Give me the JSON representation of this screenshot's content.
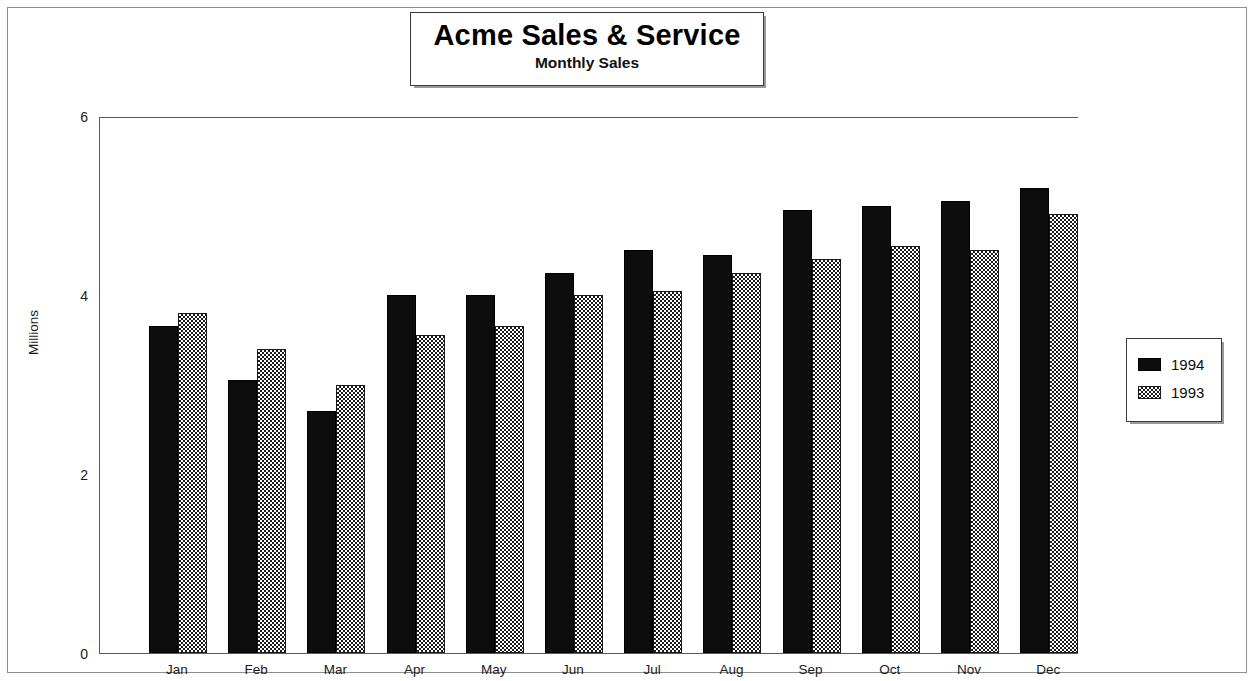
{
  "title_box": {
    "title": "Acme Sales & Service",
    "subtitle": "Monthly Sales"
  },
  "axes": {
    "y_title": "Millions",
    "y_ticks": [
      "0",
      "2",
      "4",
      "6"
    ]
  },
  "legend": {
    "items": [
      {
        "label": "1994",
        "swatch": "solid-black-swatch"
      },
      {
        "label": "1993",
        "swatch": "checkered-swatch"
      }
    ]
  },
  "chart_data": {
    "type": "bar",
    "title": "Acme Sales & Service",
    "subtitle": "Monthly Sales",
    "xlabel": "",
    "ylabel": "Millions",
    "ylim": [
      0,
      6
    ],
    "yticks": [
      0,
      2,
      4,
      6
    ],
    "grid": false,
    "legend_position": "right",
    "categories": [
      "Jan",
      "Feb",
      "Mar",
      "Apr",
      "May",
      "Jun",
      "Jul",
      "Aug",
      "Sep",
      "Oct",
      "Nov",
      "Dec"
    ],
    "series": [
      {
        "name": "1994",
        "values": [
          3.65,
          3.05,
          2.7,
          4.0,
          4.0,
          4.25,
          4.5,
          4.45,
          4.95,
          5.0,
          5.05,
          5.2
        ]
      },
      {
        "name": "1993",
        "values": [
          3.8,
          3.4,
          3.0,
          3.55,
          3.65,
          4.0,
          4.05,
          4.25,
          4.4,
          4.55,
          4.5,
          4.9
        ]
      }
    ]
  }
}
